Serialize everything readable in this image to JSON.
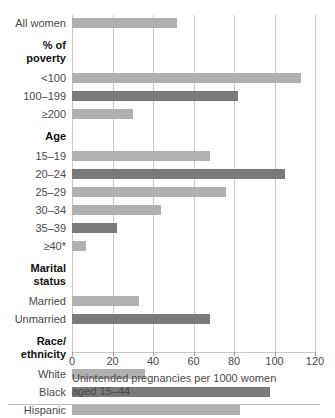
{
  "chart_data": {
    "type": "bar",
    "orientation": "horizontal",
    "title": "",
    "xlabel": "Unintended pregnancies per 1000 women aged 15–44",
    "ylabel": "",
    "xlim": [
      0,
      120
    ],
    "xticks": [
      0,
      20,
      40,
      60,
      80,
      100,
      120
    ],
    "xtick_labels": [
      "0",
      "20",
      "40",
      "60",
      "80",
      "100",
      "120"
    ],
    "grid": true,
    "legend": "none",
    "colors": {
      "bar_light": "#b0b0b0",
      "bar_dark": "#7a7a7a",
      "gridline": "#c9c9c9",
      "text": "#4a4a4a",
      "heading": "#111111"
    },
    "groups": [
      {
        "heading": "",
        "rows": [
          {
            "category": "All women",
            "value": 52,
            "shade": "light"
          }
        ]
      },
      {
        "heading": "% of\npoverty",
        "heading_lines": [
          "% of",
          "poverty"
        ],
        "rows": [
          {
            "category": "<100",
            "value": 113,
            "shade": "light"
          },
          {
            "category": "100–199",
            "value": 82,
            "shade": "dark"
          },
          {
            "category": "≥200",
            "value": 30,
            "shade": "light"
          }
        ]
      },
      {
        "heading": "Age",
        "heading_lines": [
          "Age"
        ],
        "rows": [
          {
            "category": "15–19",
            "value": 68,
            "shade": "light"
          },
          {
            "category": "20–24",
            "value": 105,
            "shade": "dark"
          },
          {
            "category": "25–29",
            "value": 76,
            "shade": "light"
          },
          {
            "category": "30–34",
            "value": 44,
            "shade": "light"
          },
          {
            "category": "35–39",
            "value": 22,
            "shade": "dark"
          },
          {
            "category": "≥40*",
            "value": 7,
            "shade": "light"
          }
        ]
      },
      {
        "heading": "Marital\nstatus",
        "heading_lines": [
          "Marital",
          "status"
        ],
        "rows": [
          {
            "category": "Married",
            "value": 33,
            "shade": "light"
          },
          {
            "category": "Unmarried",
            "value": 68,
            "shade": "dark"
          }
        ]
      },
      {
        "heading": "Race/\nethnicity",
        "heading_lines": [
          "Race/",
          "ethnicity"
        ],
        "rows": [
          {
            "category": "White",
            "value": 36,
            "shade": "light"
          },
          {
            "category": "Black",
            "value": 98,
            "shade": "dark"
          },
          {
            "category": "Hispanic",
            "value": 83,
            "shade": "light"
          }
        ]
      }
    ]
  },
  "caption": {
    "line1": "Unintended pregnancies per 1000 women",
    "line2": "aged 15–44"
  }
}
